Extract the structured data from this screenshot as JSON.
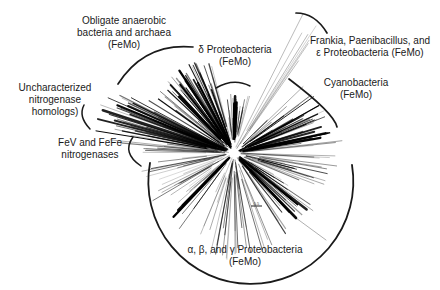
{
  "figure": {
    "type": "unrooted radial phylogenetic tree",
    "background": "#ffffff",
    "ink": "#1a1a1a"
  },
  "labels": [
    {
      "name": "obligate-anaerobes-label",
      "cx": 124,
      "top": 15,
      "w": 150,
      "lines": [
        "Obligate anaerobic",
        "bacteria and archaea",
        "(FeMo)"
      ]
    },
    {
      "name": "delta-proteobacteria-label",
      "cx": 235,
      "top": 44,
      "w": 130,
      "lines": [
        "δ Proteobacteria",
        "(FeMo)"
      ]
    },
    {
      "name": "frankia-paenibacillus-label",
      "cx": 370,
      "top": 35,
      "w": 140,
      "lines": [
        "Frankia, Paenibacillus, and",
        "ε Proteobacteria (FeMo)"
      ]
    },
    {
      "name": "cyanobacteria-label",
      "cx": 356,
      "top": 77,
      "w": 120,
      "lines": [
        "Cyanobacteria",
        "(FeMo)"
      ]
    },
    {
      "name": "uncharacterized-label",
      "cx": 55,
      "top": 82,
      "w": 110,
      "lines": [
        "Uncharacterized",
        "nitrogenase",
        "homologs)"
      ]
    },
    {
      "name": "fev-fefe-label",
      "cx": 90,
      "top": 137,
      "w": 120,
      "lines": [
        "FeV and FeFe",
        "nitrogenases"
      ]
    },
    {
      "name": "proteobacteria-label",
      "cx": 245,
      "top": 244,
      "w": 170,
      "lines": [
        "α, β, and γ Proteobacteria",
        "(FeMo)"
      ]
    }
  ],
  "arcs": [
    {
      "name": "obligate-anaerobes-bracket",
      "d": "M 118 84 Q 144.5 42.5 193 47",
      "w": 1.7
    },
    {
      "name": "delta-proteobacteria-bracket",
      "d": "M 216 88 Q 233.5 77.5 250 86",
      "w": 1.5
    },
    {
      "name": "frankia-bracket",
      "d": "M 296 13 Q 315 13 327 33",
      "w": 1.7
    },
    {
      "name": "cyanobacteria-bracket",
      "d": "M 289 79 Q 334 113 337 127",
      "w": 1.7
    },
    {
      "name": "uncharacterized-bracket",
      "d": "M 84 105 Q 78 116.5 90 129",
      "w": 1.5
    },
    {
      "name": "fev-fefe-bracket",
      "d": "M 133 137 Q 121.5 153 141 166",
      "w": 1.5
    },
    {
      "name": "proteobacteria-bracket",
      "d": "M 150 163 A 102.5 102.5 0 1 0 352 165",
      "w": 1.8
    }
  ],
  "scale_bar": {
    "x1": 251,
    "y1": 206,
    "x2": 262,
    "y2": 206,
    "label": "0.5"
  },
  "tree": {
    "cx": 234,
    "cy": 153,
    "clusters": [
      {
        "name": "uncharacterized-homologs",
        "a0": -176,
        "a1": -151,
        "n": 34,
        "rmin": 55,
        "rmax": 145,
        "wmin": 0.4,
        "wmax": 1.4,
        "omin": 0.35,
        "omax": 1.0,
        "bold": {
          "a0": -168,
          "a1": -155,
          "n": 6
        }
      },
      {
        "name": "obligate-anaerobes",
        "a0": -149,
        "a1": -104,
        "n": 46,
        "rmin": 35,
        "rmax": 102,
        "wmin": 0.4,
        "wmax": 1.4,
        "omin": 0.35,
        "omax": 1.0,
        "bold": {
          "a0": -140,
          "a1": -115,
          "n": 7
        }
      },
      {
        "name": "delta-proteobacteria",
        "a0": -101,
        "a1": -75,
        "n": 20,
        "rmin": 26,
        "rmax": 60,
        "wmin": 0.35,
        "wmax": 1.0,
        "omin": 0.3,
        "omax": 0.85,
        "bold": {
          "a0": -94,
          "a1": -84,
          "n": 3
        }
      },
      {
        "name": "frankia-clade",
        "a0": -67,
        "a1": -54,
        "n": 5,
        "rmin": 70,
        "rmax": 148,
        "wmin": 0.5,
        "wmax": 0.9,
        "omin": 0.18,
        "omax": 0.38
      },
      {
        "name": "cyanobacteria",
        "a0": -45,
        "a1": -7,
        "n": 38,
        "rmin": 35,
        "rmax": 100,
        "wmin": 0.4,
        "wmax": 1.3,
        "omin": 0.35,
        "omax": 1.0,
        "bold": {
          "a0": -26,
          "a1": -10,
          "n": 6
        }
      },
      {
        "name": "right-rays",
        "a0": -7,
        "a1": 10,
        "n": 10,
        "rmin": 45,
        "rmax": 112,
        "wmin": 0.4,
        "wmax": 1.0,
        "omin": 0.25,
        "omax": 0.7
      },
      {
        "name": "proteobacteria-right",
        "a0": 10,
        "a1": 60,
        "n": 36,
        "rmin": 30,
        "rmax": 98,
        "wmin": 0.4,
        "wmax": 1.2,
        "omin": 0.3,
        "omax": 0.9,
        "bold": {
          "a0": 36,
          "a1": 48,
          "n": 4
        }
      },
      {
        "name": "proteobacteria-down",
        "a0": 60,
        "a1": 110,
        "n": 24,
        "rmin": 25,
        "rmax": 108,
        "wmin": 0.35,
        "wmax": 1.0,
        "omin": 0.25,
        "omax": 0.8
      },
      {
        "name": "proteobacteria-left",
        "a0": 110,
        "a1": 169,
        "n": 30,
        "rmin": 28,
        "rmax": 95,
        "wmin": 0.35,
        "wmax": 1.0,
        "omin": 0.25,
        "omax": 0.8,
        "bold": {
          "a0": 124,
          "a1": 140,
          "n": 3
        }
      },
      {
        "name": "fev-fefe",
        "a0": 173,
        "a1": 187,
        "n": 7,
        "rmin": 50,
        "rmax": 92,
        "wmin": 0.4,
        "wmax": 0.9,
        "omin": 0.3,
        "omax": 0.7
      }
    ],
    "special": [
      {
        "name": "branch-dark-streak",
        "x1": 240,
        "y1": 160,
        "x2": 296,
        "y2": 218,
        "w": 2.6,
        "o": 0.95
      },
      {
        "name": "branch-streak-tail",
        "x1": 296,
        "y1": 218,
        "x2": 326,
        "y2": 240,
        "w": 0.7,
        "o": 0.45
      },
      {
        "name": "branch-frankia-long",
        "x1": 236,
        "y1": 147,
        "x2": 303,
        "y2": 14,
        "w": 0.9,
        "o": 0.3
      },
      {
        "name": "branch-frankia-long2",
        "x1": 237,
        "y1": 148,
        "x2": 316,
        "y2": 26,
        "w": 0.7,
        "o": 0.25
      }
    ]
  }
}
